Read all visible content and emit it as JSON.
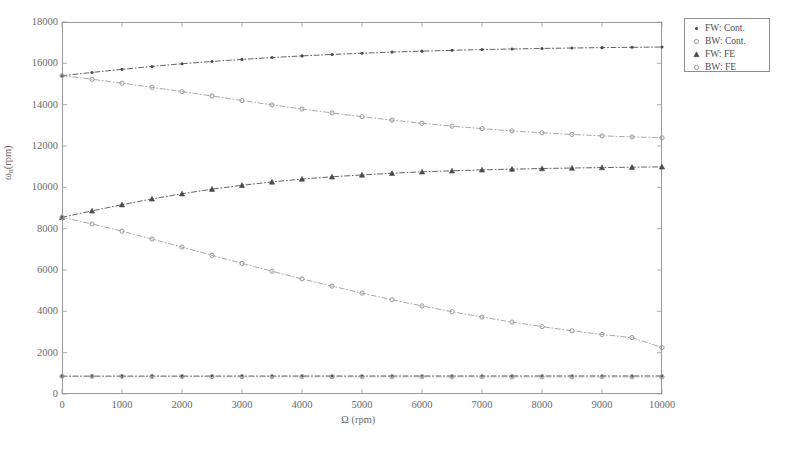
{
  "chart_data": {
    "type": "line",
    "title": "",
    "xlabel": "Ω (rpm)",
    "ylabel": "ωn (rpm)",
    "ylabel_base": "ω",
    "ylabel_sub": "n",
    "ylabel_unit": " (rpm)",
    "xlabel_base": "Ω",
    "xlabel_unit": " (rpm)",
    "xlim": [
      0,
      10000
    ],
    "ylim": [
      0,
      18000
    ],
    "xticks": [
      0,
      1000,
      2000,
      3000,
      4000,
      5000,
      6000,
      7000,
      8000,
      9000,
      10000
    ],
    "yticks": [
      0,
      2000,
      4000,
      6000,
      8000,
      10000,
      12000,
      14000,
      16000,
      18000
    ],
    "grid": false,
    "legend_position": "upper-right-outside",
    "x": [
      0,
      500,
      1000,
      1500,
      2000,
      2500,
      3000,
      3500,
      4000,
      4500,
      5000,
      5500,
      6000,
      6500,
      7000,
      7500,
      8000,
      8500,
      9000,
      9500,
      10000
    ],
    "series": [
      {
        "name": "FW: Cont.",
        "marker": "dot",
        "color": "#4a4a4a",
        "mode": "forward-whirl-mode-2",
        "values": [
          15400,
          15560,
          15710,
          15850,
          15980,
          16090,
          16190,
          16280,
          16360,
          16430,
          16490,
          16545,
          16590,
          16630,
          16665,
          16695,
          16720,
          16742,
          16760,
          16775,
          16790
        ]
      },
      {
        "name": "BW: Cont.",
        "marker": "circle",
        "color": "#9a9a9a",
        "mode": "backward-whirl-mode-2",
        "values": [
          15400,
          15230,
          15040,
          14840,
          14630,
          14420,
          14200,
          13990,
          13790,
          13600,
          13420,
          13250,
          13100,
          12960,
          12840,
          12730,
          12640,
          12560,
          12490,
          12440,
          12400
        ]
      },
      {
        "name": "FW: FE",
        "marker": "triangle",
        "color": "#4a4a4a",
        "mode": "forward-whirl-mode-1",
        "values": [
          8550,
          8860,
          9160,
          9440,
          9690,
          9910,
          10100,
          10260,
          10400,
          10510,
          10600,
          10680,
          10750,
          10800,
          10845,
          10880,
          10910,
          10935,
          10955,
          10975,
          10990
        ]
      },
      {
        "name": "BW: FE",
        "marker": "circle",
        "color": "#9a9a9a",
        "mode": "backward-whirl-mode-1",
        "values": [
          8550,
          8230,
          7880,
          7500,
          7110,
          6710,
          6320,
          5940,
          5570,
          5220,
          4880,
          4560,
          4260,
          3980,
          3720,
          3480,
          3260,
          3060,
          2880,
          2730,
          2250
        ]
      },
      {
        "name": "FW: rigid-body",
        "marker": "dot",
        "color": "#4a4a4a",
        "mode": "rigid-body-forward",
        "values": [
          860,
          862,
          864,
          866,
          867,
          868,
          869,
          870,
          870,
          871,
          871,
          872,
          872,
          872,
          873,
          873,
          873,
          873,
          874,
          874,
          874
        ]
      },
      {
        "name": "BW: rigid-body",
        "marker": "circle",
        "color": "#9a9a9a",
        "mode": "rigid-body-backward",
        "values": [
          860,
          856,
          852,
          849,
          846,
          844,
          842,
          840,
          839,
          838,
          837,
          836,
          835,
          834,
          834,
          833,
          833,
          832,
          832,
          831,
          831
        ]
      }
    ]
  },
  "legend": {
    "entries": [
      {
        "label": "FW: Cont.",
        "marker": "dot",
        "color": "#4a4a4a"
      },
      {
        "label": "BW: Cont.",
        "marker": "circle",
        "color": "#9a9a9a"
      },
      {
        "label": "FW: FE",
        "marker": "triangle",
        "color": "#4a4a4a"
      },
      {
        "label": "BW: FE",
        "marker": "circle",
        "color": "#9a9a9a"
      }
    ]
  },
  "caption": {
    "text": ""
  },
  "colors": {
    "axis": "#9a9a9a",
    "tick_text": "#6b6b6b",
    "dark_series": "#4a4a4a",
    "light_series": "#9a9a9a",
    "background": "#ffffff"
  }
}
